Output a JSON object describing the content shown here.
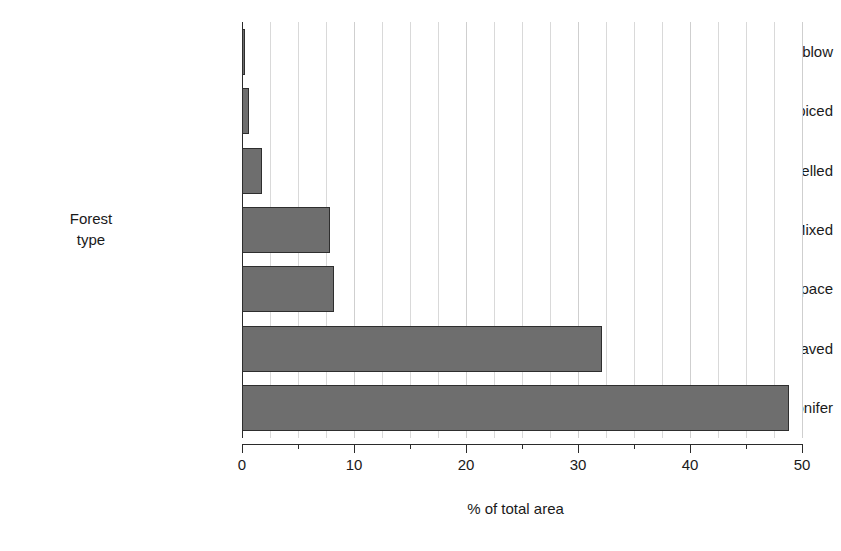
{
  "chart_data": {
    "type": "bar",
    "orientation": "horizontal",
    "title": "",
    "xlabel": "% of total area",
    "ylabel": "Forest type",
    "ylabel_lines": [
      "Forest",
      "type"
    ],
    "categories": [
      "Windblow",
      "Coppiced",
      "Felled",
      "Mixed",
      "Open space",
      "Broadleaved",
      "Conifer"
    ],
    "values": [
      0.3,
      0.6,
      1.8,
      7.9,
      8.2,
      32.1,
      48.8
    ],
    "xlim": [
      0,
      50
    ],
    "xticks": [
      0,
      10,
      20,
      30,
      40,
      50
    ],
    "xtick_labels": [
      "0",
      "10",
      "20",
      "30",
      "40",
      "50"
    ],
    "xminor_tick_step": 5,
    "gridline_step": 2.5,
    "grid": true,
    "legend": false,
    "colors": {
      "bar_fill": "#6e6e6e",
      "bar_stroke": "#2e2e2e",
      "gridline": "#d9d9d9",
      "axis": "#2b2b2b",
      "text": "#1a1a1a",
      "background": "#ffffff"
    }
  }
}
